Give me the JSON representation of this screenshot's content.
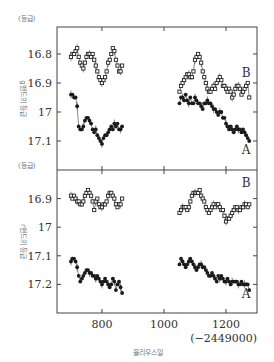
{
  "chart_data": {
    "type": "scatter",
    "title": "",
    "xlabel": "율리우스일",
    "x_offset_note": "(−2449000)",
    "xlim": [
      655,
      1300
    ],
    "x_ticks": [
      800,
      1000,
      1200
    ],
    "grid": false,
    "panels": [
      {
        "name": "g-band",
        "ylabel": "g밴드의 등급",
        "unit": "(등급)",
        "ylim": [
          17.2,
          16.707
        ],
        "y_ticks": [
          16.8,
          16.9,
          17,
          17.1
        ],
        "y_tick_labels": [
          "16.8",
          "16.9",
          "17",
          "17.1"
        ],
        "series": [
          {
            "name": "B",
            "marker": "open-square",
            "label_pos": [
              1265,
              16.865
            ],
            "x": [
              700,
              705,
              710,
              715,
              720,
              725,
              730,
              735,
              740,
              745,
              750,
              755,
              760,
              765,
              770,
              775,
              780,
              785,
              790,
              795,
              800,
              805,
              810,
              815,
              820,
              825,
              830,
              835,
              840,
              845,
              850,
              855,
              860,
              865,
              1050,
              1055,
              1060,
              1065,
              1070,
              1075,
              1080,
              1085,
              1090,
              1095,
              1100,
              1105,
              1110,
              1115,
              1120,
              1125,
              1130,
              1135,
              1140,
              1145,
              1150,
              1155,
              1160,
              1165,
              1170,
              1175,
              1180,
              1185,
              1190,
              1195,
              1200,
              1205,
              1210,
              1215,
              1220,
              1225,
              1230,
              1235,
              1240,
              1245,
              1250,
              1255,
              1260,
              1265,
              1270,
              1275
            ],
            "y": [
              16.81,
              16.8,
              16.8,
              16.79,
              16.78,
              16.81,
              16.83,
              16.84,
              16.85,
              16.83,
              16.81,
              16.8,
              16.8,
              16.81,
              16.8,
              16.82,
              16.84,
              16.86,
              16.88,
              16.89,
              16.9,
              16.89,
              16.88,
              16.86,
              16.83,
              16.82,
              16.8,
              16.78,
              16.79,
              16.82,
              16.84,
              16.86,
              16.86,
              16.84,
              16.93,
              16.91,
              16.9,
              16.89,
              16.88,
              16.87,
              16.87,
              16.88,
              16.88,
              16.86,
              16.82,
              16.81,
              16.8,
              16.81,
              16.83,
              16.86,
              16.88,
              16.9,
              16.92,
              16.93,
              16.93,
              16.92,
              16.91,
              16.92,
              16.9,
              16.89,
              16.88,
              16.89,
              16.91,
              16.91,
              16.92,
              16.93,
              16.92,
              16.93,
              16.95,
              16.94,
              16.92,
              16.91,
              16.91,
              16.92,
              16.94,
              16.93,
              16.92,
              16.91,
              16.9,
              16.95
            ]
          },
          {
            "name": "A",
            "marker": "filled-circle",
            "label_pos": [
              1265,
              17.13
            ],
            "x": [
              700,
              705,
              710,
              715,
              720,
              725,
              730,
              735,
              740,
              745,
              750,
              755,
              760,
              765,
              770,
              775,
              780,
              785,
              790,
              795,
              800,
              805,
              810,
              815,
              820,
              825,
              830,
              835,
              840,
              845,
              850,
              855,
              860,
              865,
              1050,
              1055,
              1060,
              1065,
              1070,
              1075,
              1080,
              1085,
              1090,
              1095,
              1100,
              1105,
              1110,
              1115,
              1120,
              1125,
              1130,
              1135,
              1140,
              1145,
              1150,
              1155,
              1160,
              1165,
              1170,
              1175,
              1180,
              1185,
              1190,
              1195,
              1200,
              1205,
              1210,
              1215,
              1220,
              1225,
              1230,
              1235,
              1240,
              1245,
              1250,
              1255,
              1260,
              1265,
              1270,
              1275
            ],
            "y": [
              16.94,
              16.94,
              16.95,
              16.95,
              16.98,
              17.05,
              17.06,
              17.06,
              17.05,
              17.03,
              17.02,
              17.02,
              17.03,
              17.04,
              17.06,
              17.07,
              17.06,
              17.08,
              17.09,
              17.1,
              17.11,
              17.09,
              17.08,
              17.08,
              17.07,
              17.06,
              17.05,
              17.06,
              17.04,
              17.05,
              17.04,
              17.06,
              17.06,
              17.05,
              16.97,
              16.95,
              16.95,
              16.96,
              16.94,
              16.96,
              16.97,
              16.95,
              16.97,
              16.97,
              16.95,
              16.96,
              16.97,
              16.97,
              16.98,
              16.99,
              16.97,
              16.97,
              16.96,
              16.97,
              16.97,
              16.98,
              16.99,
              16.99,
              17.0,
              17.01,
              17.0,
              17.0,
              17.02,
              17.02,
              17.04,
              17.05,
              17.06,
              17.05,
              17.06,
              17.07,
              17.06,
              17.05,
              17.06,
              17.06,
              17.07,
              17.06,
              17.07,
              17.08,
              17.09,
              17.1
            ]
          }
        ]
      },
      {
        "name": "r-band",
        "ylabel": "r밴드의 등급",
        "unit": "(등급)",
        "ylim": [
          17.3,
          16.8
        ],
        "y_ticks": [
          16.9,
          17,
          17.1,
          17.2
        ],
        "y_tick_labels": [
          "16.9",
          "17",
          "17.1",
          "17.2"
        ],
        "series": [
          {
            "name": "B",
            "marker": "open-square",
            "label_pos": [
              1265,
              16.845
            ],
            "x": [
              700,
              705,
              710,
              715,
              720,
              725,
              730,
              735,
              740,
              745,
              750,
              755,
              760,
              765,
              770,
              775,
              780,
              785,
              790,
              795,
              800,
              805,
              810,
              815,
              820,
              825,
              830,
              835,
              840,
              845,
              850,
              855,
              860,
              865,
              1050,
              1055,
              1060,
              1065,
              1070,
              1075,
              1080,
              1085,
              1090,
              1095,
              1100,
              1105,
              1110,
              1115,
              1120,
              1125,
              1130,
              1135,
              1140,
              1145,
              1150,
              1155,
              1160,
              1165,
              1170,
              1175,
              1180,
              1185,
              1190,
              1195,
              1200,
              1205,
              1210,
              1215,
              1220,
              1225,
              1230,
              1235,
              1240,
              1245,
              1250,
              1255,
              1260,
              1265,
              1270,
              1275
            ],
            "y": [
              16.89,
              16.9,
              16.89,
              16.9,
              16.91,
              16.91,
              16.92,
              16.92,
              16.91,
              16.89,
              16.88,
              16.87,
              16.88,
              16.89,
              16.91,
              16.94,
              16.91,
              16.9,
              16.92,
              16.93,
              16.93,
              16.92,
              16.92,
              16.91,
              16.89,
              16.88,
              16.88,
              16.89,
              16.9,
              16.92,
              16.93,
              16.92,
              16.92,
              16.9,
              16.95,
              16.94,
              16.93,
              16.93,
              16.93,
              16.94,
              16.93,
              16.91,
              16.89,
              16.88,
              16.88,
              16.88,
              16.88,
              16.87,
              16.89,
              16.9,
              16.91,
              16.93,
              16.94,
              16.95,
              16.94,
              16.93,
              16.92,
              16.93,
              16.92,
              16.92,
              16.93,
              16.94,
              16.94,
              16.96,
              16.98,
              16.97,
              16.97,
              16.96,
              16.95,
              16.94,
              16.93,
              16.93,
              16.94,
              16.94,
              16.93,
              16.93,
              16.92,
              16.92,
              16.93,
              16.92
            ]
          },
          {
            "name": "A",
            "marker": "filled-circle",
            "label_pos": [
              1265,
              17.235
            ],
            "x": [
              700,
              705,
              710,
              715,
              720,
              725,
              730,
              735,
              740,
              745,
              750,
              755,
              760,
              765,
              770,
              775,
              780,
              785,
              790,
              795,
              800,
              805,
              810,
              815,
              820,
              825,
              830,
              835,
              840,
              845,
              850,
              855,
              860,
              865,
              1050,
              1055,
              1060,
              1065,
              1070,
              1075,
              1080,
              1085,
              1090,
              1095,
              1100,
              1105,
              1110,
              1115,
              1120,
              1125,
              1130,
              1135,
              1140,
              1145,
              1150,
              1155,
              1160,
              1165,
              1170,
              1175,
              1180,
              1185,
              1190,
              1195,
              1200,
              1205,
              1210,
              1215,
              1220,
              1225,
              1230,
              1235,
              1240,
              1245,
              1250,
              1255,
              1260,
              1265,
              1270,
              1275
            ],
            "y": [
              17.12,
              17.11,
              17.11,
              17.12,
              17.14,
              17.17,
              17.19,
              17.18,
              17.17,
              17.16,
              17.15,
              17.15,
              17.16,
              17.16,
              17.17,
              17.17,
              17.18,
              17.17,
              17.18,
              17.19,
              17.2,
              17.19,
              17.18,
              17.19,
              17.2,
              17.21,
              17.2,
              17.18,
              17.19,
              17.22,
              17.2,
              17.19,
              17.21,
              17.23,
              17.13,
              17.11,
              17.12,
              17.13,
              17.14,
              17.13,
              17.12,
              17.11,
              17.12,
              17.13,
              17.14,
              17.15,
              17.14,
              17.13,
              17.13,
              17.14,
              17.14,
              17.15,
              17.16,
              17.17,
              17.17,
              17.16,
              17.17,
              17.18,
              17.19,
              17.17,
              17.18,
              17.17,
              17.18,
              17.19,
              17.19,
              17.18,
              17.19,
              17.2,
              17.19,
              17.19,
              17.19,
              17.19,
              17.2,
              17.2,
              17.19,
              17.2,
              17.2,
              17.2,
              17.2,
              17.22
            ]
          }
        ]
      }
    ]
  },
  "layout": {
    "frame": {
      "left": 57,
      "right": 257,
      "top": 27,
      "mid": 170,
      "bottom": 313
    },
    "x_px_per_unit": 0.31,
    "colors": {
      "axis": "#444444",
      "open_marker": "#222222",
      "filled_marker": "#1a1a1a",
      "line": "#555555"
    }
  }
}
